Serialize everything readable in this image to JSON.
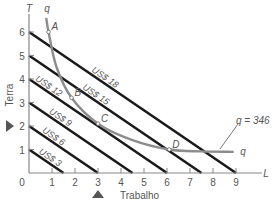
{
  "chart_data": {
    "type": "line",
    "title": "",
    "xlabel": "Trabalho",
    "ylabel": "Terra",
    "x_axis_symbol": "L",
    "y_axis_symbol": "T",
    "xlim": [
      0,
      9
    ],
    "ylim": [
      0,
      6
    ],
    "x_ticks": [
      "0",
      "1",
      "2",
      "3",
      "4",
      "5",
      "6",
      "7",
      "8",
      "9"
    ],
    "y_ticks": [
      "1",
      "2",
      "3",
      "4",
      "5",
      "6"
    ],
    "grid": false,
    "isocost_lines": [
      {
        "label": "US$ 3",
        "y_intercept": 1,
        "x_intercept": 1.5
      },
      {
        "label": "US$ 6",
        "y_intercept": 2,
        "x_intercept": 3
      },
      {
        "label": "US$ 9",
        "y_intercept": 3,
        "x_intercept": 4.5
      },
      {
        "label": "US$ 12",
        "y_intercept": 4,
        "x_intercept": 6
      },
      {
        "label": "US$ 15",
        "y_intercept": 5,
        "x_intercept": 7.5
      },
      {
        "label": "US$ 18",
        "y_intercept": 6,
        "x_intercept": 9
      }
    ],
    "isoquant": {
      "label_start": "q",
      "label_end": "q",
      "annotation": "q = 346",
      "points": [
        {
          "x": 0.75,
          "y": 6.6
        },
        {
          "x": 0.85,
          "y": 6.0
        },
        {
          "x": 1.2,
          "y": 4.5
        },
        {
          "x": 1.85,
          "y": 3.2
        },
        {
          "x": 3.0,
          "y": 2.1
        },
        {
          "x": 4.5,
          "y": 1.4
        },
        {
          "x": 6.1,
          "y": 1.0
        },
        {
          "x": 7.5,
          "y": 0.92
        },
        {
          "x": 8.9,
          "y": 0.9
        }
      ]
    },
    "labeled_points": [
      {
        "label": "A",
        "x": 0.85,
        "y": 6.0
      },
      {
        "label": "B",
        "x": 1.85,
        "y": 3.2
      },
      {
        "label": "C",
        "x": 3.0,
        "y": 2.1
      },
      {
        "label": "D",
        "x": 6.1,
        "y": 1.0
      }
    ],
    "markers": [
      {
        "axis": "y",
        "value": 2,
        "shape": "triangle-right"
      },
      {
        "axis": "x",
        "value": 3,
        "shape": "triangle-up"
      }
    ]
  }
}
